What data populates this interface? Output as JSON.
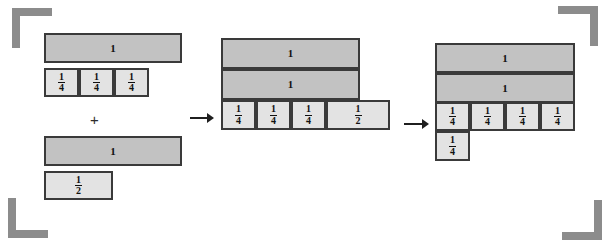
{
  "figure": {
    "colors": {
      "whole_fill": "#c2c2c2",
      "fraction_fill": "#e3e3e3",
      "border": "#3a3a3a",
      "bracket": "#8c8c8c",
      "background": "#ffffff"
    },
    "operators": {
      "plus": "+",
      "arrow_1": "arrow-right",
      "arrow_2": "arrow-right"
    },
    "brackets": [
      {
        "name": "top-left",
        "label": "crop-bracket"
      },
      {
        "name": "top-right",
        "label": "crop-bracket"
      },
      {
        "name": "bottom-left",
        "label": "crop-bracket"
      },
      {
        "name": "bottom-right",
        "label": "crop-bracket"
      }
    ],
    "groups": [
      {
        "name": "addend-one",
        "rows": [
          {
            "name": "whole-bar",
            "cells": [
              {
                "label": "1",
                "type": "whole"
              }
            ]
          },
          {
            "name": "quarters-row",
            "cells": [
              {
                "label": "1/4",
                "num": "1",
                "den": "4",
                "type": "frac"
              },
              {
                "label": "1/4",
                "num": "1",
                "den": "4",
                "type": "frac"
              },
              {
                "label": "1/4",
                "num": "1",
                "den": "4",
                "type": "frac"
              }
            ]
          }
        ]
      },
      {
        "name": "addend-two",
        "rows": [
          {
            "name": "whole-bar",
            "cells": [
              {
                "label": "1",
                "type": "whole"
              }
            ]
          },
          {
            "name": "half-row",
            "cells": [
              {
                "label": "1/2",
                "num": "1",
                "den": "2",
                "type": "frac"
              }
            ]
          }
        ]
      },
      {
        "name": "intermediate-sum",
        "rows": [
          {
            "name": "whole-bar-top",
            "cells": [
              {
                "label": "1",
                "type": "whole"
              }
            ]
          },
          {
            "name": "whole-bar-bottom",
            "cells": [
              {
                "label": "1",
                "type": "whole"
              }
            ]
          },
          {
            "name": "fraction-row",
            "cells": [
              {
                "label": "1/4",
                "num": "1",
                "den": "4",
                "type": "frac"
              },
              {
                "label": "1/4",
                "num": "1",
                "den": "4",
                "type": "frac"
              },
              {
                "label": "1/4",
                "num": "1",
                "den": "4",
                "type": "frac"
              },
              {
                "label": "1/2",
                "num": "1",
                "den": "2",
                "type": "frac"
              }
            ]
          }
        ]
      },
      {
        "name": "final-sum",
        "rows": [
          {
            "name": "whole-bar-top",
            "cells": [
              {
                "label": "1",
                "type": "whole"
              }
            ]
          },
          {
            "name": "whole-bar-bottom",
            "cells": [
              {
                "label": "1",
                "type": "whole"
              }
            ]
          },
          {
            "name": "quarters-row",
            "cells": [
              {
                "label": "1/4",
                "num": "1",
                "den": "4",
                "type": "frac"
              },
              {
                "label": "1/4",
                "num": "1",
                "den": "4",
                "type": "frac"
              },
              {
                "label": "1/4",
                "num": "1",
                "den": "4",
                "type": "frac"
              },
              {
                "label": "1/4",
                "num": "1",
                "den": "4",
                "type": "frac"
              }
            ]
          },
          {
            "name": "remainder-row",
            "cells": [
              {
                "label": "1/4",
                "num": "1",
                "den": "4",
                "type": "frac"
              }
            ]
          }
        ]
      }
    ]
  }
}
